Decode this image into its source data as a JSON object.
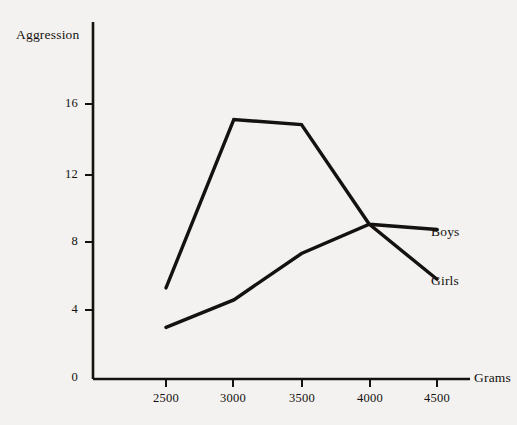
{
  "chart_data": {
    "type": "line",
    "title": "",
    "xlabel": "Grams",
    "ylabel": "Aggression",
    "x": [
      2500,
      3000,
      3500,
      4000,
      4500
    ],
    "xticks": [
      "2500",
      "3000",
      "3500",
      "4000",
      "4500"
    ],
    "yticks": [
      "0",
      "4",
      "8",
      "12",
      "16"
    ],
    "xlim": [
      2380,
      4630
    ],
    "ylim": [
      0,
      19.5
    ],
    "grid": false,
    "legend_position": "right-inline-labels",
    "series": [
      {
        "name": "Boys",
        "values": [
          5.3,
          15.1,
          14.8,
          9.0,
          8.7
        ],
        "color": "#14110f"
      },
      {
        "name": "Girls",
        "values": [
          3.0,
          4.6,
          7.3,
          9.0,
          5.8
        ],
        "color": "#14110f"
      }
    ]
  },
  "axes": {
    "y_axis_title": "Aggression",
    "x_axis_title": "Grams",
    "y_tick_labels": [
      "16",
      "12",
      "8",
      "4",
      "0"
    ],
    "x_tick_labels": [
      "2500",
      "3000",
      "3500",
      "4000",
      "4500"
    ]
  },
  "series_labels": {
    "boys": "Boys",
    "girls": "Girls"
  },
  "colors": {
    "background": "#f3f2f0",
    "ink": "#14110f",
    "line": "#14110f"
  }
}
